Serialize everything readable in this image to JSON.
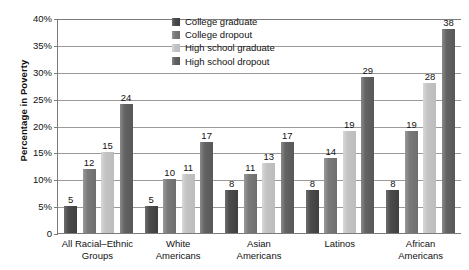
{
  "chart_data": {
    "type": "bar",
    "title": "",
    "xlabel": "",
    "ylabel": "Percentage in Poverty",
    "ylim": [
      0,
      40
    ],
    "ytick_labels": [
      "40%",
      "35%",
      "30%",
      "25%",
      "20%",
      "15%",
      "10%",
      "5%",
      "0"
    ],
    "ytick_values": [
      40,
      35,
      30,
      25,
      20,
      15,
      10,
      5,
      0
    ],
    "grid": true,
    "legend_position": "top-center",
    "categories": [
      "All Racial–Ethnic Groups",
      "White Americans",
      "Asian Americans",
      "Latinos",
      "African Americans"
    ],
    "category_lines": [
      [
        "All Racial–Ethnic",
        "Groups"
      ],
      [
        "White",
        "Americans"
      ],
      [
        "Asian",
        "Americans"
      ],
      [
        "Latinos",
        ""
      ],
      [
        "African",
        "Americans"
      ]
    ],
    "series": [
      {
        "name": "College graduate",
        "color": "#4b4b4b",
        "values": [
          5,
          5,
          8,
          8,
          8
        ]
      },
      {
        "name": "College dropout",
        "color": "#7a7a7a",
        "values": [
          12,
          10,
          11,
          14,
          19
        ]
      },
      {
        "name": "High school graduate",
        "color": "#c3c3c3",
        "values": [
          15,
          11,
          13,
          19,
          28
        ]
      },
      {
        "name": "High school dropout",
        "color": "#636363",
        "values": [
          24,
          17,
          17,
          29,
          38
        ]
      }
    ]
  },
  "colors": {
    "axis": "#7b7b7b",
    "grid": "#9a9a9a",
    "text": "#111111",
    "background": "#ffffff"
  }
}
